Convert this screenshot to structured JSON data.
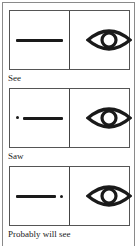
{
  "panels": [
    {
      "label": "See",
      "time_marker": "line-only",
      "symbol": "eye-icon"
    },
    {
      "label": "Saw",
      "time_marker": "dot-before-line",
      "symbol": "eye-icon"
    },
    {
      "label": "Probably will see",
      "time_marker": "dot-after-line",
      "symbol": "eye-icon"
    }
  ],
  "colors": {
    "ink": "#1a1a1a",
    "border": "#555555",
    "background": "#ffffff"
  }
}
